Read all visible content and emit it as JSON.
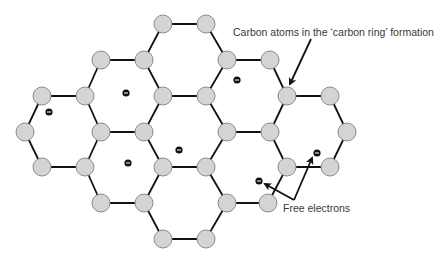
{
  "labels": {
    "carbon_atoms": "Carbon atoms in the ‘carbon ring’ formation",
    "free_electrons": "Free electrons"
  },
  "colors": {
    "atom_fill": "#d4d4d4",
    "atom_stroke": "#8a8a8a",
    "bond": "#111111",
    "electron": "#111111",
    "electron_sign": "#ffffff",
    "arrow": "#111111",
    "text": "#3a3a3a"
  },
  "atom_radius": 9,
  "atoms": [
    [
      163,
      24
    ],
    [
      206,
      24
    ],
    [
      101,
      60
    ],
    [
      144,
      60
    ],
    [
      227,
      60
    ],
    [
      270,
      60
    ],
    [
      42,
      96
    ],
    [
      85,
      96
    ],
    [
      163,
      96
    ],
    [
      206,
      96
    ],
    [
      287,
      96
    ],
    [
      330,
      96
    ],
    [
      25,
      132
    ],
    [
      101,
      132
    ],
    [
      144,
      132
    ],
    [
      227,
      132
    ],
    [
      270,
      132
    ],
    [
      347,
      132
    ],
    [
      42,
      167
    ],
    [
      85,
      167
    ],
    [
      163,
      167
    ],
    [
      206,
      167
    ],
    [
      287,
      167
    ],
    [
      330,
      167
    ],
    [
      101,
      203
    ],
    [
      144,
      203
    ],
    [
      227,
      203
    ],
    [
      268,
      203
    ],
    [
      163,
      239
    ],
    [
      206,
      239
    ]
  ],
  "hexagons": [
    [
      [
        163,
        24
      ],
      [
        206,
        24
      ],
      [
        227,
        60
      ],
      [
        206,
        96
      ],
      [
        163,
        96
      ],
      [
        144,
        60
      ]
    ],
    [
      [
        101,
        60
      ],
      [
        144,
        60
      ],
      [
        163,
        96
      ],
      [
        144,
        132
      ],
      [
        101,
        132
      ],
      [
        85,
        96
      ]
    ],
    [
      [
        227,
        60
      ],
      [
        270,
        60
      ],
      [
        287,
        96
      ],
      [
        270,
        132
      ],
      [
        227,
        132
      ],
      [
        206,
        96
      ]
    ],
    [
      [
        42,
        96
      ],
      [
        85,
        96
      ],
      [
        101,
        132
      ],
      [
        85,
        167
      ],
      [
        42,
        167
      ],
      [
        25,
        132
      ]
    ],
    [
      [
        163,
        96
      ],
      [
        206,
        96
      ],
      [
        227,
        132
      ],
      [
        206,
        167
      ],
      [
        163,
        167
      ],
      [
        144,
        132
      ]
    ],
    [
      [
        287,
        96
      ],
      [
        330,
        96
      ],
      [
        347,
        132
      ],
      [
        330,
        167
      ],
      [
        287,
        167
      ],
      [
        270,
        132
      ]
    ],
    [
      [
        101,
        132
      ],
      [
        144,
        132
      ],
      [
        163,
        167
      ],
      [
        144,
        203
      ],
      [
        101,
        203
      ],
      [
        85,
        167
      ]
    ],
    [
      [
        227,
        132
      ],
      [
        270,
        132
      ],
      [
        287,
        167
      ],
      [
        268,
        203
      ],
      [
        227,
        203
      ],
      [
        206,
        167
      ]
    ],
    [
      [
        163,
        167
      ],
      [
        206,
        167
      ],
      [
        227,
        203
      ],
      [
        206,
        239
      ],
      [
        163,
        239
      ],
      [
        144,
        203
      ]
    ]
  ],
  "electrons": [
    [
      49,
      112
    ],
    [
      126,
      93
    ],
    [
      128,
      163
    ],
    [
      179,
      150
    ],
    [
      237,
      80
    ],
    [
      317,
      153
    ],
    [
      259,
      181
    ]
  ],
  "arrows": {
    "carbon": {
      "from": [
        311,
        39
      ],
      "to": [
        290,
        84
      ]
    },
    "free": [
      {
        "from": [
          294,
          200
        ],
        "to": [
          312,
          158
        ]
      },
      {
        "from": [
          294,
          200
        ],
        "to": [
          265,
          184
        ]
      }
    ]
  }
}
